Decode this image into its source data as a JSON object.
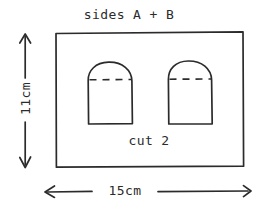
{
  "diagram": {
    "title": "sides A + B",
    "note": "cut 2",
    "dimensions": {
      "width_label": "15cm",
      "height_label": "11cm"
    },
    "colors": {
      "ink": "#2b2b2b",
      "background": "#ffffff"
    },
    "panel": {
      "shape": "rectangle",
      "x": 55,
      "y": 32,
      "width": 188,
      "height": 135
    },
    "pieces": [
      {
        "name": "arch-piece-left",
        "x": 88,
        "y": 62,
        "width": 44,
        "height": 62,
        "fold_line": "dashed"
      },
      {
        "name": "arch-piece-right",
        "x": 168,
        "y": 61,
        "width": 44,
        "height": 63,
        "fold_line": "dashed"
      }
    ]
  }
}
